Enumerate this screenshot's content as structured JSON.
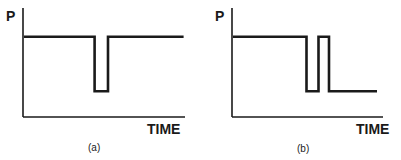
{
  "figure": {
    "panels": [
      {
        "id": "a",
        "caption": "(a)",
        "y_label": "P",
        "x_label": "TIME",
        "description": "Constant pressure with a single brief drop returning to the original level",
        "trace": {
          "x_range": [
            0,
            100
          ],
          "y_range": [
            0,
            100
          ],
          "points": [
            [
              0,
              75
            ],
            [
              42,
              75
            ],
            [
              42,
              24
            ],
            [
              50,
              24
            ],
            [
              50,
              75
            ],
            [
              95,
              75
            ]
          ]
        }
      },
      {
        "id": "b",
        "caption": "(b)",
        "y_label": "P",
        "x_label": "TIME",
        "description": "Constant pressure, a drop, brief recovery to the original level, then a sustained drop to the lower level",
        "trace": {
          "x_range": [
            0,
            100
          ],
          "y_range": [
            0,
            100
          ],
          "points": [
            [
              0,
              75
            ],
            [
              49,
              75
            ],
            [
              49,
              24
            ],
            [
              57,
              24
            ],
            [
              57,
              75
            ],
            [
              64,
              75
            ],
            [
              64,
              24
            ],
            [
              96,
              24
            ]
          ]
        }
      }
    ]
  }
}
